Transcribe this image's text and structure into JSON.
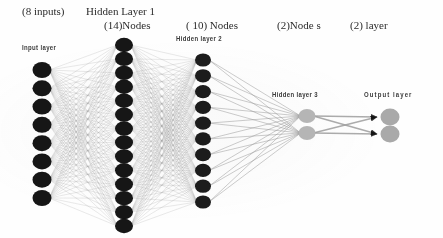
{
  "figure": {
    "title_captions": [
      {
        "id": "inputs",
        "text": "(8 inputs)"
      },
      {
        "id": "hl1",
        "text": "Hidden Layer 1"
      },
      {
        "id": "hl1_nodes",
        "text": "(14)Nodes"
      },
      {
        "id": "hl2_nodes",
        "text": "( 10) Nodes"
      },
      {
        "id": "hl3_nodes",
        "text": "(2)Node s"
      },
      {
        "id": "out_layer",
        "text": "(2) layer"
      }
    ],
    "inline_labels": [
      {
        "id": "input_layer",
        "text": "Input layer"
      },
      {
        "id": "hidden2",
        "text": "Hidden layer 2"
      },
      {
        "id": "hidden3",
        "text": "Hidden layer 3"
      },
      {
        "id": "output_layer",
        "text": "Output layer"
      }
    ]
  },
  "chart_data": {
    "type": "diagram",
    "layers": [
      {
        "name": "Input layer",
        "node_count": 8,
        "x": 42,
        "y_top": 70,
        "y_bottom": 198,
        "node_rx": 9.5,
        "node_ry": 8.0,
        "fill": "#141414"
      },
      {
        "name": "Hidden layer 1",
        "node_count": 14,
        "x": 124,
        "y_top": 45,
        "y_bottom": 226,
        "node_rx": 9.0,
        "node_ry": 7.2,
        "fill": "#141414"
      },
      {
        "name": "Hidden layer 2",
        "node_count": 10,
        "x": 203,
        "y_top": 60,
        "y_bottom": 202,
        "node_rx": 8.0,
        "node_ry": 6.6,
        "fill": "#1a1a1a"
      },
      {
        "name": "Hidden layer 3",
        "node_count": 2,
        "x": 307,
        "y_top": 116,
        "y_bottom": 133,
        "node_rx": 8.5,
        "node_ry": 7.0,
        "fill": "#b7b7b7"
      },
      {
        "name": "Output layer",
        "node_count": 2,
        "x": 390,
        "y_top": 117,
        "y_bottom": 134,
        "node_rx": 9.5,
        "node_ry": 8.5,
        "fill": "#a9a9a9"
      }
    ],
    "connections": [
      {
        "from": "Input layer",
        "to": "Hidden layer 1",
        "style": "fully-connected",
        "stroke": "#9a9a9a",
        "width": 0.35
      },
      {
        "from": "Hidden layer 1",
        "to": "Hidden layer 2",
        "style": "fully-connected",
        "stroke": "#9a9a9a",
        "width": 0.35
      },
      {
        "from": "Hidden layer 2",
        "to": "Hidden layer 3",
        "style": "fully-connected",
        "stroke": "#8d8d8d",
        "width": 0.7
      },
      {
        "from": "Hidden layer 3",
        "to": "Output layer",
        "style": "fully-connected-arrow",
        "stroke": "#9e9e9e",
        "width": 1.6
      }
    ],
    "arrowheads": {
      "count": 2,
      "color": "#111111",
      "at_layer": "Output layer"
    },
    "colors": {
      "background": "#ffffff",
      "dark_node": "#141414",
      "light_node": "#b2b2b2",
      "edge": "#9a9a9a",
      "text": "#2b2b2b"
    }
  }
}
